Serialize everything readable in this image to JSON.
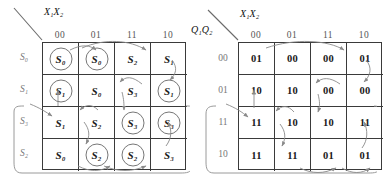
{
  "figure": {
    "maps": [
      {
        "id": "symbolic-state-map",
        "col_axis_label": "X₁X₂",
        "row_axis_label": "",
        "col_headers": [
          "00",
          "01",
          "11",
          "10"
        ],
        "row_headers": [
          "S₀",
          "S₁",
          "S₃",
          "S₂"
        ],
        "rows": [
          [
            {
              "text": "S₀",
              "circled": true
            },
            {
              "text": "S₀",
              "circled": true
            },
            {
              "text": "S₂",
              "circled": false
            },
            {
              "text": "S₁",
              "circled": false
            }
          ],
          [
            {
              "text": "S₁",
              "circled": true
            },
            {
              "text": "S₀",
              "circled": false
            },
            {
              "text": "S₃",
              "circled": false
            },
            {
              "text": "S₁",
              "circled": true
            }
          ],
          [
            {
              "text": "S₁",
              "circled": false
            },
            {
              "text": "S₂",
              "circled": false
            },
            {
              "text": "S₃",
              "circled": true
            },
            {
              "text": "S₃",
              "circled": true
            }
          ],
          [
            {
              "text": "S₀",
              "circled": false
            },
            {
              "text": "S₂",
              "circled": true
            },
            {
              "text": "S₂",
              "circled": true
            },
            {
              "text": "S₃",
              "circled": false
            }
          ]
        ]
      },
      {
        "id": "encoded-state-map",
        "col_axis_label": "X₁X₂",
        "row_axis_label": "Q₁Q₂",
        "col_headers": [
          "00",
          "01",
          "11",
          "10"
        ],
        "row_headers": [
          "00",
          "01",
          "11",
          "10"
        ],
        "rows": [
          [
            {
              "text": "01",
              "circled": false
            },
            {
              "text": "00",
              "circled": false
            },
            {
              "text": "00",
              "circled": false
            },
            {
              "text": "01",
              "circled": false
            }
          ],
          [
            {
              "text": "10",
              "circled": false
            },
            {
              "text": "10",
              "circled": false
            },
            {
              "text": "00",
              "circled": false
            },
            {
              "text": "00",
              "circled": false
            }
          ],
          [
            {
              "text": "11",
              "circled": false
            },
            {
              "text": "10",
              "circled": false
            },
            {
              "text": "10",
              "circled": false
            },
            {
              "text": "11",
              "circled": false
            }
          ],
          [
            {
              "text": "11",
              "circled": false
            },
            {
              "text": "11",
              "circled": false
            },
            {
              "text": "01",
              "circled": false
            },
            {
              "text": "01",
              "circled": false
            }
          ]
        ]
      }
    ],
    "colors": {
      "grid_line": "#3a3a3a",
      "arrow": "#8a8a8a",
      "circle": "#777777",
      "header_text": "#777777",
      "cell_text": "#111111",
      "wrap_bracket": "#9a9a9a"
    }
  }
}
